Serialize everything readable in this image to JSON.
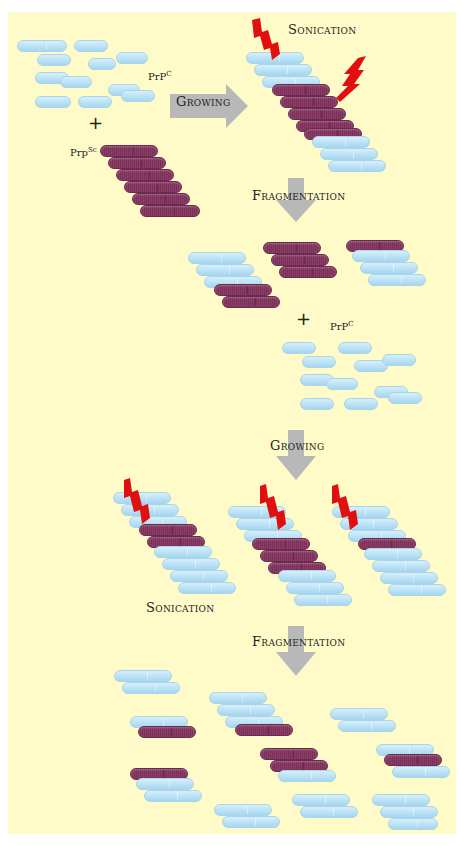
{
  "colors": {
    "background": "#fffbc8",
    "prp_c": "#b8e0f5",
    "prp_sc": "#7a3058",
    "arrow": "#b8b8b8",
    "bolt": "#e01010"
  },
  "labels": {
    "growing_1": "Growing",
    "sonication_1": "Sonication",
    "fragmentation_1": "Fragmentation",
    "prpc_1": "PrP",
    "prpc_1_sup": "C",
    "prpsc": "Prp",
    "prpsc_sup": "Sc",
    "prpc_2": "PrP",
    "prpc_2_sup": "C",
    "plus_1": "+",
    "plus_2": "+",
    "growing_2": "Growing",
    "sonication_2": "Sonication",
    "fragmentation_2": "Fragmentation"
  },
  "pills": [
    {
      "x": 17,
      "y": 40,
      "w": 50,
      "t": "c"
    },
    {
      "x": 74,
      "y": 40,
      "w": 34,
      "t": "c"
    },
    {
      "x": 37,
      "y": 54,
      "w": 34,
      "t": "c"
    },
    {
      "x": 88,
      "y": 58,
      "w": 28,
      "t": "c"
    },
    {
      "x": 116,
      "y": 52,
      "w": 32,
      "t": "c"
    },
    {
      "x": 35,
      "y": 72,
      "w": 34,
      "t": "c"
    },
    {
      "x": 60,
      "y": 76,
      "w": 32,
      "t": "c"
    },
    {
      "x": 108,
      "y": 84,
      "w": 32,
      "t": "c"
    },
    {
      "x": 121,
      "y": 90,
      "w": 34,
      "t": "c"
    },
    {
      "x": 35,
      "y": 96,
      "w": 36,
      "t": "c"
    },
    {
      "x": 78,
      "y": 96,
      "w": 34,
      "t": "c"
    },
    {
      "x": 100,
      "y": 145,
      "w": 58,
      "t": "sc"
    },
    {
      "x": 108,
      "y": 157,
      "w": 58,
      "t": "sc"
    },
    {
      "x": 116,
      "y": 169,
      "w": 58,
      "t": "sc"
    },
    {
      "x": 124,
      "y": 181,
      "w": 58,
      "t": "sc"
    },
    {
      "x": 132,
      "y": 193,
      "w": 58,
      "t": "sc"
    },
    {
      "x": 140,
      "y": 205,
      "w": 60,
      "t": "sc"
    },
    {
      "x": 246,
      "y": 52,
      "w": 58,
      "t": "c"
    },
    {
      "x": 254,
      "y": 64,
      "w": 58,
      "t": "c"
    },
    {
      "x": 262,
      "y": 76,
      "w": 58,
      "t": "c"
    },
    {
      "x": 272,
      "y": 84,
      "w": 58,
      "t": "sc"
    },
    {
      "x": 280,
      "y": 96,
      "w": 58,
      "t": "sc"
    },
    {
      "x": 288,
      "y": 108,
      "w": 58,
      "t": "sc"
    },
    {
      "x": 296,
      "y": 120,
      "w": 58,
      "t": "sc"
    },
    {
      "x": 304,
      "y": 128,
      "w": 58,
      "t": "sc"
    },
    {
      "x": 312,
      "y": 136,
      "w": 58,
      "t": "c"
    },
    {
      "x": 320,
      "y": 148,
      "w": 58,
      "t": "c"
    },
    {
      "x": 328,
      "y": 160,
      "w": 58,
      "t": "c"
    },
    {
      "x": 188,
      "y": 252,
      "w": 58,
      "t": "c"
    },
    {
      "x": 196,
      "y": 264,
      "w": 58,
      "t": "c"
    },
    {
      "x": 204,
      "y": 276,
      "w": 58,
      "t": "c"
    },
    {
      "x": 214,
      "y": 284,
      "w": 58,
      "t": "sc"
    },
    {
      "x": 222,
      "y": 296,
      "w": 58,
      "t": "sc"
    },
    {
      "x": 263,
      "y": 242,
      "w": 58,
      "t": "sc"
    },
    {
      "x": 271,
      "y": 254,
      "w": 58,
      "t": "sc"
    },
    {
      "x": 279,
      "y": 266,
      "w": 58,
      "t": "sc"
    },
    {
      "x": 346,
      "y": 240,
      "w": 58,
      "t": "sc"
    },
    {
      "x": 352,
      "y": 250,
      "w": 58,
      "t": "c"
    },
    {
      "x": 360,
      "y": 262,
      "w": 58,
      "t": "c"
    },
    {
      "x": 368,
      "y": 274,
      "w": 58,
      "t": "c"
    },
    {
      "x": 282,
      "y": 342,
      "w": 34,
      "t": "c"
    },
    {
      "x": 338,
      "y": 342,
      "w": 34,
      "t": "c"
    },
    {
      "x": 302,
      "y": 356,
      "w": 34,
      "t": "c"
    },
    {
      "x": 354,
      "y": 360,
      "w": 34,
      "t": "c"
    },
    {
      "x": 382,
      "y": 354,
      "w": 34,
      "t": "c"
    },
    {
      "x": 300,
      "y": 374,
      "w": 34,
      "t": "c"
    },
    {
      "x": 326,
      "y": 378,
      "w": 32,
      "t": "c"
    },
    {
      "x": 374,
      "y": 386,
      "w": 34,
      "t": "c"
    },
    {
      "x": 388,
      "y": 392,
      "w": 34,
      "t": "c"
    },
    {
      "x": 300,
      "y": 398,
      "w": 34,
      "t": "c"
    },
    {
      "x": 344,
      "y": 398,
      "w": 34,
      "t": "c"
    },
    {
      "x": 113,
      "y": 492,
      "w": 58,
      "t": "c"
    },
    {
      "x": 121,
      "y": 504,
      "w": 58,
      "t": "c"
    },
    {
      "x": 129,
      "y": 516,
      "w": 58,
      "t": "c"
    },
    {
      "x": 139,
      "y": 524,
      "w": 58,
      "t": "sc"
    },
    {
      "x": 147,
      "y": 536,
      "w": 58,
      "t": "sc"
    },
    {
      "x": 154,
      "y": 546,
      "w": 58,
      "t": "c"
    },
    {
      "x": 162,
      "y": 558,
      "w": 58,
      "t": "c"
    },
    {
      "x": 170,
      "y": 570,
      "w": 58,
      "t": "c"
    },
    {
      "x": 178,
      "y": 582,
      "w": 58,
      "t": "c"
    },
    {
      "x": 228,
      "y": 506,
      "w": 58,
      "t": "c"
    },
    {
      "x": 236,
      "y": 518,
      "w": 58,
      "t": "c"
    },
    {
      "x": 244,
      "y": 530,
      "w": 58,
      "t": "c"
    },
    {
      "x": 252,
      "y": 538,
      "w": 58,
      "t": "sc"
    },
    {
      "x": 260,
      "y": 550,
      "w": 58,
      "t": "sc"
    },
    {
      "x": 268,
      "y": 562,
      "w": 58,
      "t": "sc"
    },
    {
      "x": 278,
      "y": 570,
      "w": 58,
      "t": "c"
    },
    {
      "x": 286,
      "y": 582,
      "w": 58,
      "t": "c"
    },
    {
      "x": 294,
      "y": 594,
      "w": 58,
      "t": "c"
    },
    {
      "x": 332,
      "y": 506,
      "w": 58,
      "t": "c"
    },
    {
      "x": 340,
      "y": 518,
      "w": 58,
      "t": "c"
    },
    {
      "x": 348,
      "y": 530,
      "w": 58,
      "t": "c"
    },
    {
      "x": 358,
      "y": 538,
      "w": 58,
      "t": "sc"
    },
    {
      "x": 364,
      "y": 548,
      "w": 58,
      "t": "c"
    },
    {
      "x": 372,
      "y": 560,
      "w": 58,
      "t": "c"
    },
    {
      "x": 380,
      "y": 572,
      "w": 58,
      "t": "c"
    },
    {
      "x": 388,
      "y": 584,
      "w": 58,
      "t": "c"
    },
    {
      "x": 114,
      "y": 670,
      "w": 58,
      "t": "c"
    },
    {
      "x": 122,
      "y": 682,
      "w": 58,
      "t": "c"
    },
    {
      "x": 130,
      "y": 716,
      "w": 58,
      "t": "c"
    },
    {
      "x": 138,
      "y": 726,
      "w": 58,
      "t": "sc"
    },
    {
      "x": 130,
      "y": 768,
      "w": 58,
      "t": "sc"
    },
    {
      "x": 136,
      "y": 778,
      "w": 58,
      "t": "c"
    },
    {
      "x": 144,
      "y": 790,
      "w": 58,
      "t": "c"
    },
    {
      "x": 209,
      "y": 692,
      "w": 58,
      "t": "c"
    },
    {
      "x": 217,
      "y": 704,
      "w": 58,
      "t": "c"
    },
    {
      "x": 225,
      "y": 716,
      "w": 58,
      "t": "c"
    },
    {
      "x": 235,
      "y": 724,
      "w": 58,
      "t": "sc"
    },
    {
      "x": 260,
      "y": 748,
      "w": 58,
      "t": "sc"
    },
    {
      "x": 270,
      "y": 760,
      "w": 58,
      "t": "sc"
    },
    {
      "x": 278,
      "y": 770,
      "w": 58,
      "t": "c"
    },
    {
      "x": 330,
      "y": 708,
      "w": 58,
      "t": "c"
    },
    {
      "x": 338,
      "y": 720,
      "w": 58,
      "t": "c"
    },
    {
      "x": 376,
      "y": 744,
      "w": 58,
      "t": "c"
    },
    {
      "x": 384,
      "y": 754,
      "w": 58,
      "t": "sc"
    },
    {
      "x": 392,
      "y": 766,
      "w": 58,
      "t": "c"
    },
    {
      "x": 214,
      "y": 804,
      "w": 58,
      "t": "c"
    },
    {
      "x": 222,
      "y": 816,
      "w": 58,
      "t": "c"
    },
    {
      "x": 292,
      "y": 794,
      "w": 58,
      "t": "c"
    },
    {
      "x": 300,
      "y": 806,
      "w": 58,
      "t": "c"
    },
    {
      "x": 372,
      "y": 794,
      "w": 58,
      "t": "c"
    },
    {
      "x": 380,
      "y": 806,
      "w": 58,
      "t": "c"
    },
    {
      "x": 388,
      "y": 818,
      "w": 50,
      "t": "c"
    }
  ]
}
